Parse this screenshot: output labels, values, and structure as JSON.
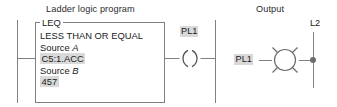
{
  "diagram": {
    "sections": {
      "ladder_heading": "Ladder logic program",
      "output_heading": "Output"
    },
    "colors": {
      "wire": "#808080",
      "text": "#1a1a1a",
      "highlight": "#d9d9d9",
      "background": "#ffffff"
    },
    "leq_block": {
      "title": "LEQ",
      "description": "LESS THAN OR EQUAL",
      "source_a_label": "Source",
      "source_a_operand": "A",
      "source_a_value": "C5:1.ACC",
      "source_b_label": "Source",
      "source_b_operand": "B",
      "source_b_value": "457"
    },
    "coil": {
      "label": "PL1",
      "symbol": "output-coil"
    },
    "output_wiring": {
      "lamp_label": "PL1",
      "supply_label": "L2",
      "lamp_symbol": "pilot-light"
    }
  }
}
